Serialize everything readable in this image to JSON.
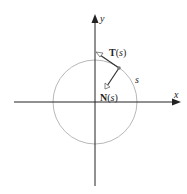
{
  "diagram": {
    "axes": {
      "x_label": "x",
      "y_label": "y"
    },
    "labels": {
      "tangent_bold": "T",
      "tangent_open": "(",
      "tangent_var": "s",
      "tangent_close": ")",
      "normal_bold": "N",
      "normal_open": "(",
      "normal_var": "s",
      "normal_close": ")",
      "arc_length": "s"
    },
    "colors": {
      "axis": "#222222",
      "circle": "#b8b8b8",
      "vector": "#333333",
      "point": "#777777"
    }
  }
}
